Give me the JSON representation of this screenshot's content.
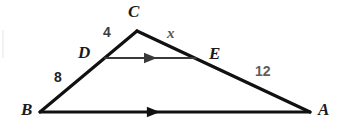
{
  "figure": {
    "kind": "geometry-diagram",
    "background_color": "#ffffff",
    "stroke_color": "#111111"
  },
  "vertices": [
    {
      "name": "A",
      "label": "A",
      "x": 310,
      "y": 112,
      "label_x": 318,
      "label_y": 101
    },
    {
      "name": "B",
      "label": "B",
      "x": 40,
      "y": 112,
      "label_x": 21,
      "label_y": 101
    },
    {
      "name": "C",
      "label": "C",
      "x": 137,
      "y": 31,
      "label_x": 128,
      "label_y": 3
    },
    {
      "name": "D",
      "label": "D",
      "x": 105,
      "y": 58,
      "label_x": 78,
      "label_y": 44
    },
    {
      "name": "E",
      "label": "E",
      "x": 196,
      "y": 58,
      "label_x": 209,
      "label_y": 45
    }
  ],
  "segments": [
    {
      "name": "BC",
      "from": "B",
      "to": "C",
      "stroke_width": 3.2,
      "color": "#111111",
      "arrow": false
    },
    {
      "name": "CA",
      "from": "C",
      "to": "A",
      "stroke_width": 3.2,
      "color": "#111111",
      "arrow": false
    },
    {
      "name": "BA",
      "from": "B",
      "to": "A",
      "stroke_width": 3.0,
      "color": "#111111",
      "arrow": true,
      "arrow_t": 0.42
    },
    {
      "name": "DE",
      "from": "D",
      "to": "E",
      "stroke_width": 2.2,
      "color": "#3a3a3a",
      "arrow": true,
      "arrow_t": 0.5
    }
  ],
  "measures": [
    {
      "name": "cd-length",
      "text": "4",
      "x": 103,
      "y": 25,
      "style": "measure-mid",
      "segment": "CD"
    },
    {
      "name": "ce-length",
      "text": "x",
      "x": 167,
      "y": 26,
      "style": "measure-var",
      "segment": "CE"
    },
    {
      "name": "bd-length",
      "text": "8",
      "x": 54,
      "y": 70,
      "style": "measure-dark",
      "segment": "BD"
    },
    {
      "name": "ea-length",
      "text": "12",
      "x": 255,
      "y": 64,
      "style": "measure-gray",
      "segment": "EA"
    }
  ],
  "artifacts": [
    {
      "name": "scan-streak-left",
      "x": 2,
      "y": 30,
      "width": 2,
      "height": 28
    }
  ]
}
